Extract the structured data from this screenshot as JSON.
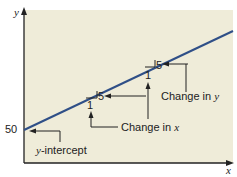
{
  "diagram": {
    "axes": {
      "x_label": "x",
      "y_label": "y"
    },
    "y_intercept_value": "50",
    "y_intercept_label_prefix": "y",
    "y_intercept_label_suffix": "-intercept",
    "slope_triangles": [
      {
        "run": "1",
        "rise": "5"
      },
      {
        "run": "1",
        "rise": "5"
      }
    ],
    "annotations": {
      "change_in_x_prefix": "Change in ",
      "change_in_x_var": "x",
      "change_in_y_prefix": "Change in ",
      "change_in_y_var": "y"
    },
    "colors": {
      "panel": "#efecd9",
      "line": "#2f4f87",
      "axis": "#222222"
    }
  }
}
